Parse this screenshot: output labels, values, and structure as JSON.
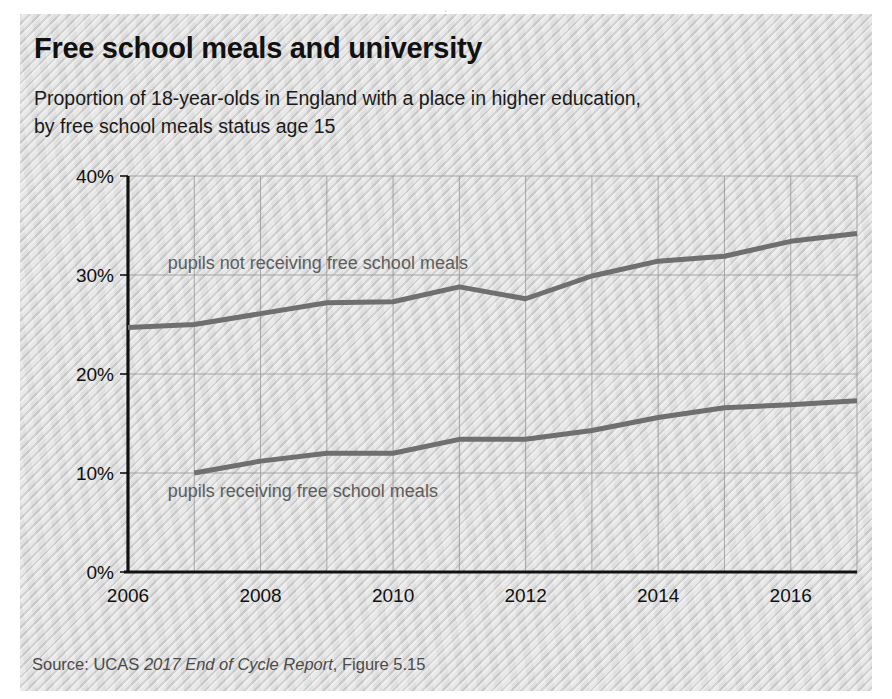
{
  "page": {
    "top_fragment": "."
  },
  "figure": {
    "title": "Free school meals and university",
    "subtitle": "Proportion of 18-year-olds in England with a place in higher education, by free school meals status age 15",
    "source_prefix": "Source: UCAS ",
    "source_italic": "2017 End of Cycle Report",
    "source_suffix": ", Figure 5.15"
  },
  "colors": {
    "panel_background": "#d7d7d7",
    "line": "#6f6f6f",
    "axis": "#111111",
    "grid": "#9a9a9a",
    "title_text": "#111111",
    "label_text": "#5d5d5d",
    "source_text": "#4a4a4a"
  },
  "chart_data": {
    "type": "line",
    "title": "Free school meals and university",
    "subtitle": "Proportion of 18-year-olds in England with a place in higher education, by free school meals status age 15",
    "xlabel": "",
    "ylabel": "",
    "x": [
      2006,
      2007,
      2008,
      2009,
      2010,
      2011,
      2012,
      2013,
      2014,
      2015,
      2016,
      2017
    ],
    "xlim": [
      2006,
      2017
    ],
    "ylim": [
      0,
      40
    ],
    "ytick_labels": [
      "0%",
      "10%",
      "20%",
      "30%",
      "40%"
    ],
    "ytick_values": [
      0,
      10,
      20,
      30,
      40
    ],
    "xtick_labels": [
      "2006",
      "2008",
      "2010",
      "2012",
      "2014",
      "2016"
    ],
    "xtick_values": [
      2006,
      2008,
      2010,
      2012,
      2014,
      2016
    ],
    "grid": "both, every year on x and every 10% on y",
    "legend": "inline labels on plot",
    "series": [
      {
        "name": "pupils not receiving free school meals",
        "label_x": 2006.6,
        "label_y": 30.6,
        "x": [
          2006,
          2007,
          2008,
          2009,
          2010,
          2011,
          2012,
          2013,
          2014,
          2015,
          2016,
          2017
        ],
        "values": [
          24.7,
          25.0,
          26.1,
          27.2,
          27.3,
          28.8,
          27.6,
          29.9,
          31.4,
          31.9,
          33.4,
          34.2
        ]
      },
      {
        "name": "pupils receiving free school meals",
        "label_x": 2006.6,
        "label_y": 7.6,
        "x": [
          2007,
          2008,
          2009,
          2010,
          2011,
          2012,
          2013,
          2014,
          2015,
          2016,
          2017
        ],
        "values": [
          10.0,
          11.2,
          12.0,
          12.0,
          13.4,
          13.4,
          14.3,
          15.6,
          16.6,
          16.9,
          17.3
        ]
      }
    ]
  }
}
